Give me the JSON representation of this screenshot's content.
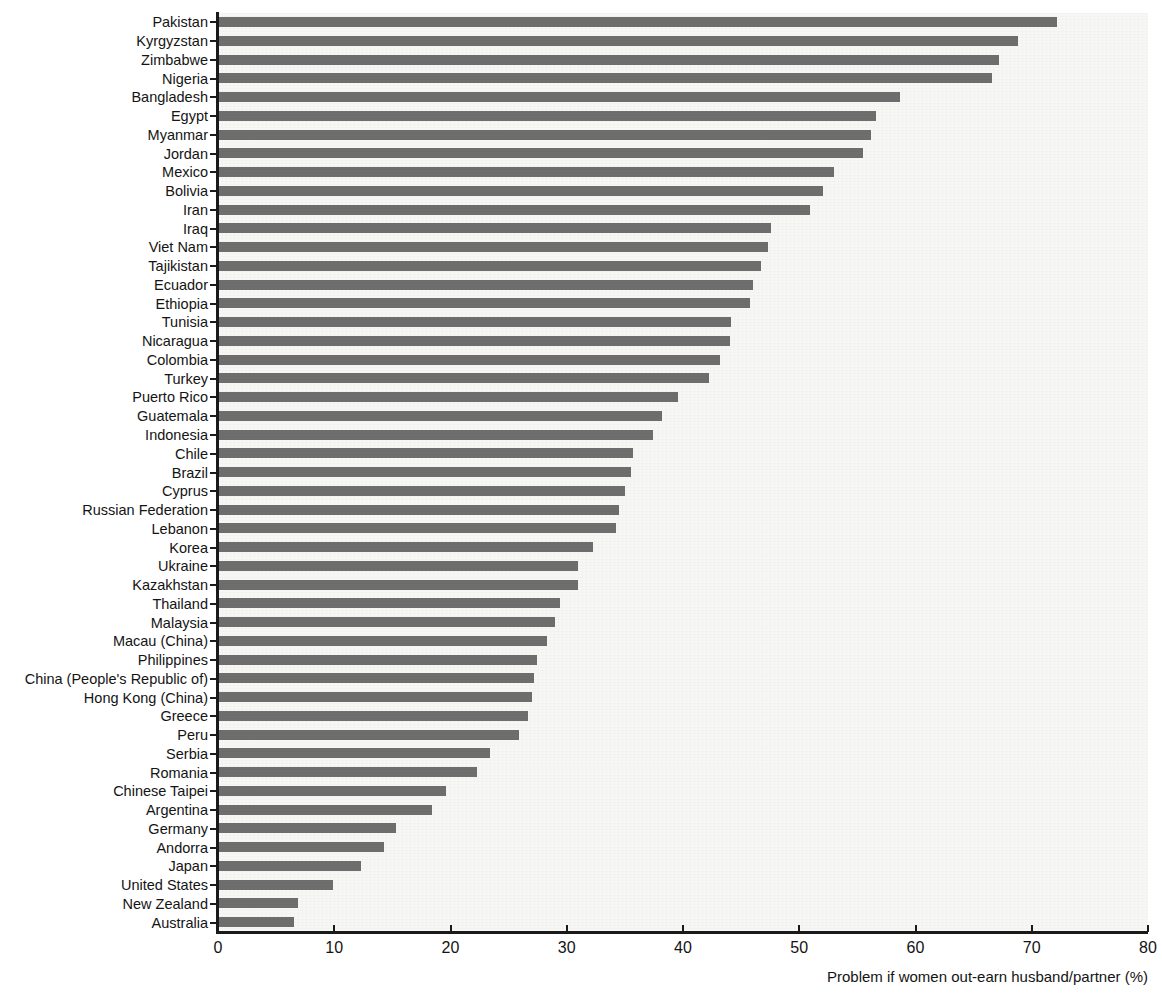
{
  "chart_data": {
    "type": "bar",
    "orientation": "horizontal",
    "title": "",
    "xlabel": "Problem if women out-earn husband/partner (%)",
    "ylabel": "",
    "xlim": [
      0,
      80
    ],
    "xticks": [
      0,
      10,
      20,
      30,
      40,
      50,
      60,
      70,
      80
    ],
    "xtick_labels": [
      "0",
      "10",
      "20",
      "30",
      "40",
      "50",
      "60",
      "70",
      "80"
    ],
    "grid": false,
    "legend": null,
    "bar_color": "#6e6e6e",
    "plot_background": "#f7f7f5",
    "categories": [
      "Pakistan",
      "Kyrgyzstan",
      "Zimbabwe",
      "Nigeria",
      "Bangladesh",
      "Egypt",
      "Myanmar",
      "Jordan",
      "Mexico",
      "Bolivia",
      "Iran",
      "Iraq",
      "Viet Nam",
      "Tajikistan",
      "Ecuador",
      "Ethiopia",
      "Tunisia",
      "Nicaragua",
      "Colombia",
      "Turkey",
      "Puerto Rico",
      "Guatemala",
      "Indonesia",
      "Chile",
      "Brazil",
      "Cyprus",
      "Russian Federation",
      "Lebanon",
      "Korea",
      "Ukraine",
      "Kazakhstan",
      "Thailand",
      "Malaysia",
      "Macau (China)",
      "Philippines",
      "China (People's Republic of)",
      "Hong Kong (China)",
      "Greece",
      "Peru",
      "Serbia",
      "Romania",
      "Chinese Taipei",
      "Argentina",
      "Germany",
      "Andorra",
      "Japan",
      "United States",
      "New Zealand",
      "Australia"
    ],
    "values": [
      72.2,
      68.8,
      67.2,
      66.6,
      58.7,
      56.6,
      56.2,
      55.5,
      53.0,
      52.0,
      50.9,
      47.6,
      47.3,
      46.7,
      46.0,
      45.8,
      44.1,
      44.0,
      43.2,
      42.2,
      39.6,
      38.2,
      37.4,
      35.7,
      35.5,
      35.0,
      34.5,
      34.2,
      32.3,
      31.0,
      31.0,
      29.4,
      29.0,
      28.3,
      27.4,
      27.2,
      27.0,
      26.7,
      25.9,
      23.4,
      22.3,
      19.6,
      18.4,
      15.3,
      14.3,
      12.3,
      9.9,
      6.9,
      6.5
    ]
  }
}
